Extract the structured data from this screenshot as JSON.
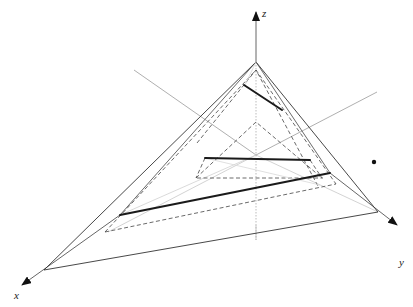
{
  "diagram": {
    "type": "3d-coordinate-pyramid",
    "axes": {
      "x_label": "x",
      "y_label": "y",
      "z_label": "z"
    },
    "colors": {
      "solid": "#333333",
      "thick": "#1a1a1a",
      "dashed": "#444444",
      "guide": "#999999",
      "faint": "#cccccc"
    },
    "point": {
      "label": "",
      "description": "isolated dot to the right of the pyramid"
    }
  }
}
